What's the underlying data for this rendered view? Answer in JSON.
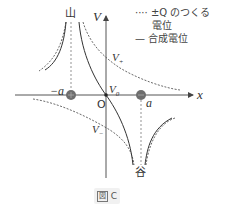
{
  "figure": {
    "caption_prefix": "図",
    "caption_id": "C"
  },
  "axes": {
    "x_label": "x",
    "y_label": "V",
    "origin_label": "O",
    "v0_label": "V",
    "v0_sub": "0",
    "vplus_label": "V",
    "vplus_sub": "+",
    "vminus_label": "V",
    "vminus_sub": "−"
  },
  "charges": {
    "neg_pos_label": "−a",
    "pos_pos_label": "a",
    "peak_label": "山",
    "valley_label": "谷"
  },
  "legend": {
    "dotted_marker": "····",
    "dotted_text_1": "±Q のつくる",
    "dotted_text_2": "電位",
    "solid_marker": "—",
    "solid_text": "合成電位"
  },
  "colors": {
    "line": "#333333",
    "charge_fill": "#6e6e6e",
    "axis": "#555555",
    "caption_bg": "#f1f1f1"
  }
}
